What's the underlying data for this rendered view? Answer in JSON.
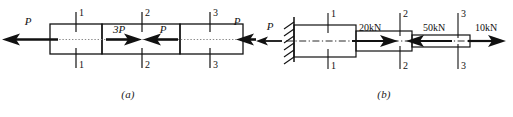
{
  "figure": {
    "width": 513,
    "height": 117,
    "background": "#ffffff",
    "line_color": "#111111",
    "panels": [
      {
        "id": "a",
        "caption": "(a)",
        "description": "Stepped axial bar in equilibrium with end loads P and internal loads 3P and P",
        "sections": [
          {
            "id": "1",
            "top_label": "1",
            "bottom_label": "1"
          },
          {
            "id": "2",
            "top_label": "2",
            "bottom_label": "2"
          },
          {
            "id": "3",
            "top_label": "3",
            "bottom_label": "3"
          }
        ],
        "forces": [
          {
            "name": "left-end-force",
            "label": "P",
            "direction": "left",
            "position": "left-end"
          },
          {
            "name": "interior-force-3p",
            "label": "3P",
            "direction": "right",
            "position": "segment-2-left"
          },
          {
            "name": "interior-force-p",
            "label": "P",
            "direction": "left",
            "position": "segment-2-right"
          },
          {
            "name": "right-end-force",
            "label": "P",
            "direction": "left",
            "position": "right-end"
          }
        ]
      },
      {
        "id": "b",
        "caption": "(b)",
        "description": "Stepped bar fixed at left wall, loaded with 20kN, 50kN and 10kN axial forces",
        "support": {
          "name": "fixed-wall-support",
          "type": "fixed",
          "hatch_count": 6
        },
        "sections": [
          {
            "id": "1",
            "top_label": "1",
            "bottom_label": "1"
          },
          {
            "id": "2",
            "top_label": "2",
            "bottom_label": "2"
          },
          {
            "id": "3",
            "top_label": "3",
            "bottom_label": "3"
          }
        ],
        "forces": [
          {
            "name": "reaction-force",
            "label": "P",
            "direction": "left",
            "position": "left-of-wall"
          },
          {
            "name": "load-20kn",
            "label": "20kN",
            "direction": "right",
            "position": "segment-1-2"
          },
          {
            "name": "load-50kn",
            "label": "50kN",
            "direction": "left",
            "position": "segment-2-3"
          },
          {
            "name": "load-10kn",
            "label": "10kN",
            "direction": "right",
            "position": "right-end"
          }
        ]
      }
    ]
  }
}
